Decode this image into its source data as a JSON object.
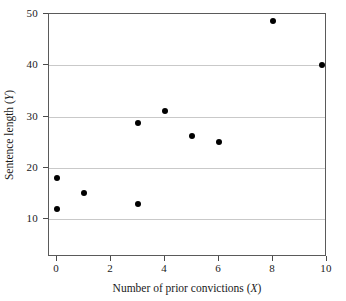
{
  "chart_data": {
    "type": "scatter",
    "title": "",
    "xlabel": "Number of prior convictions (X)",
    "ylabel": "Sentence length (Y)",
    "xlim": [
      -0.3,
      10
    ],
    "ylim": [
      2.6,
      50
    ],
    "xticks": [
      0,
      2,
      4,
      6,
      8,
      10
    ],
    "xtick_labels": [
      "0",
      "2",
      "4",
      "6",
      "8",
      "10"
    ],
    "yticks": [
      10,
      20,
      30,
      40,
      50
    ],
    "ytick_labels": [
      "10",
      "20",
      "30",
      "40",
      "50"
    ],
    "grid": "horizontal",
    "gridlines_at": [
      10,
      20,
      30,
      40
    ],
    "legend": null,
    "marker": "filled-circle",
    "marker_color": "#000000",
    "points": [
      {
        "x": 0,
        "y": 18.0
      },
      {
        "x": 0,
        "y": 12.0
      },
      {
        "x": 1,
        "y": 15.0
      },
      {
        "x": 3,
        "y": 28.8
      },
      {
        "x": 3,
        "y": 13.0
      },
      {
        "x": 4,
        "y": 31.0
      },
      {
        "x": 5,
        "y": 26.3
      },
      {
        "x": 6,
        "y": 25.0
      },
      {
        "x": 8,
        "y": 48.7
      },
      {
        "x": 9.8,
        "y": 40.0
      }
    ]
  },
  "axis_titles": {
    "x_prefix": "Number of prior convictions (",
    "x_var": "X",
    "x_suffix": ")",
    "y_prefix": "Sentence length (",
    "y_var": "Y",
    "y_suffix": ")"
  },
  "colors": {
    "marker": "#000000",
    "gridline": "#c9c9c9",
    "frame": "#5a5a5a",
    "background": "#ffffff",
    "text": "#1a1a1a"
  }
}
